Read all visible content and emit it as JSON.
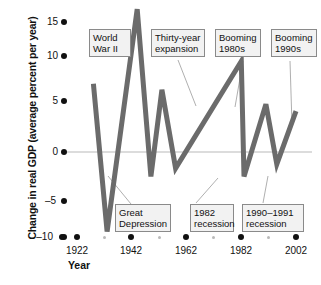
{
  "chart_data": {
    "type": "line",
    "title": "",
    "xlabel": "Year",
    "ylabel": "Change in real GDP (average percent per year)",
    "xlim": [
      1918,
      2004
    ],
    "ylim": [
      -10,
      15
    ],
    "grid": false,
    "zero_line": true,
    "legend": "none",
    "y_ticks": [
      {
        "value": 15,
        "label": "15"
      },
      {
        "value": 10,
        "label": "10"
      },
      {
        "value": 5,
        "label": "5"
      },
      {
        "value": 0,
        "label": "0"
      },
      {
        "value": -5,
        "label": "–5"
      },
      {
        "value": -10,
        "label": "–10"
      }
    ],
    "x_ticks_major": [
      {
        "value": 1922,
        "label": "1922"
      },
      {
        "value": 1942,
        "label": "1942"
      },
      {
        "value": 1962,
        "label": "1962"
      },
      {
        "value": 1982,
        "label": "1982"
      },
      {
        "value": 2002,
        "label": "2002"
      }
    ],
    "x_ticks_minor": [
      1932,
      1952,
      1972,
      1992
    ],
    "series": [
      {
        "name": "Change in real GDP",
        "color": "#6b6b6b",
        "x": [
          1928,
          1933,
          1944,
          1949,
          1953,
          1958,
          1982,
          1983,
          1991,
          1995,
          2002
        ],
        "y": [
          6.7,
          -7.8,
          14.0,
          -2.4,
          6.1,
          -1.6,
          8.9,
          -2.4,
          4.7,
          -1.2,
          4.0
        ],
        "points": [
          {
            "year": 1928,
            "value": 6.7
          },
          {
            "year": 1933,
            "value": -7.8
          },
          {
            "year": 1944,
            "value": 14.0
          },
          {
            "year": 1949,
            "value": -2.4
          },
          {
            "year": 1953,
            "value": 6.1
          },
          {
            "year": 1958,
            "value": -1.6
          },
          {
            "year": 1982,
            "value": 8.9
          },
          {
            "year": 1983,
            "value": -2.4
          },
          {
            "year": 1991,
            "value": 4.7
          },
          {
            "year": 1995,
            "value": -1.2
          },
          {
            "year": 2002,
            "value": 4.0
          }
        ]
      }
    ],
    "annotations": [
      {
        "id": "world-war-ii",
        "text": "World\nWar II"
      },
      {
        "id": "thirty-year-expansion",
        "text": "Thirty-year\nexpansion"
      },
      {
        "id": "booming-1980s",
        "text": "Booming\n1980s"
      },
      {
        "id": "booming-1990s",
        "text": "Booming\n1990s"
      },
      {
        "id": "great-depression",
        "text": "Great\nDepression"
      },
      {
        "id": "1982-recession",
        "text": "1982\nrecession"
      },
      {
        "id": "1990-1991-recession",
        "text": "1990–1991\nrecession"
      }
    ],
    "colors": {
      "line": "#6b6b6b",
      "zero_line": "#b9b9b9",
      "tick": "#111111",
      "minor_tick": "#b9b9b9",
      "callout_border": "#8a8a8a",
      "callout_fill": "#f2f2f2",
      "leader": "#9a9a9a",
      "text": "#111111",
      "background": "#ffffff"
    }
  }
}
